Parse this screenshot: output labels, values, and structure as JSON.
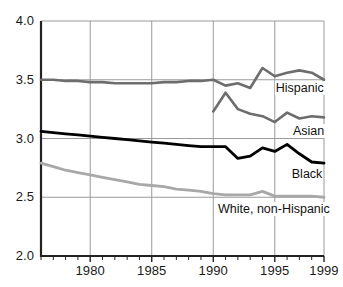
{
  "chart_data": {
    "type": "line",
    "title": "",
    "subtitle": "",
    "xlabel": "",
    "ylabel": "",
    "xlim": [
      1976,
      1999
    ],
    "ylim": [
      2.0,
      4.0
    ],
    "grid": "both",
    "legend_position": "inline-right-annotations",
    "y_ticks": [
      "4.0",
      "3.5",
      "3.0",
      "2.5",
      "2.0"
    ],
    "y_tick_values": [
      4.0,
      3.5,
      3.0,
      2.5,
      2.0
    ],
    "x_ticks": [
      "1980",
      "1985",
      "1990",
      "1995",
      "1999"
    ],
    "x_tick_values": [
      1980,
      1985,
      1990,
      1995,
      1999
    ],
    "x_minor_tick_interval": 1,
    "x": [
      1976,
      1977,
      1978,
      1979,
      1980,
      1981,
      1982,
      1983,
      1984,
      1985,
      1986,
      1987,
      1988,
      1989,
      1990,
      1991,
      1992,
      1993,
      1994,
      1995,
      1996,
      1997,
      1998,
      1999
    ],
    "series": [
      {
        "name": "Hispanic",
        "label": "Hispanic",
        "color": "#6d6d6d",
        "linewidth": 2.6,
        "values": [
          3.5,
          3.5,
          3.49,
          3.49,
          3.48,
          3.48,
          3.47,
          3.47,
          3.47,
          3.47,
          3.48,
          3.48,
          3.49,
          3.49,
          3.5,
          3.45,
          3.47,
          3.43,
          3.6,
          3.53,
          3.56,
          3.58,
          3.56,
          3.5
        ]
      },
      {
        "name": "Asian",
        "label": "Asian",
        "color": "#6d6d6d",
        "linewidth": 2.6,
        "values": [
          null,
          null,
          null,
          null,
          null,
          null,
          null,
          null,
          null,
          null,
          null,
          null,
          null,
          null,
          3.23,
          3.39,
          3.25,
          3.21,
          3.19,
          3.14,
          3.22,
          3.17,
          3.19,
          3.18
        ]
      },
      {
        "name": "Black",
        "label": "Black",
        "color": "#000000",
        "linewidth": 2.8,
        "values": [
          3.06,
          3.05,
          3.04,
          3.03,
          3.02,
          3.01,
          3.0,
          2.99,
          2.98,
          2.97,
          2.96,
          2.95,
          2.94,
          2.93,
          2.93,
          2.93,
          2.83,
          2.85,
          2.92,
          2.89,
          2.95,
          2.87,
          2.8,
          2.79
        ]
      },
      {
        "name": "White, non-Hispanic",
        "label": "White, non-Hispanic",
        "color": "#a8a8a8",
        "linewidth": 2.8,
        "values": [
          2.79,
          2.76,
          2.73,
          2.71,
          2.69,
          2.67,
          2.65,
          2.63,
          2.61,
          2.6,
          2.59,
          2.57,
          2.56,
          2.55,
          2.53,
          2.52,
          2.52,
          2.52,
          2.55,
          2.51,
          2.51,
          2.51,
          2.51,
          2.5
        ]
      }
    ],
    "annotations": [
      {
        "text": "Hispanic",
        "x": 1995.0,
        "y": 3.43
      },
      {
        "text": "Asian",
        "x": 1996.4,
        "y": 3.06
      },
      {
        "text": "Black",
        "x": 1996.3,
        "y": 2.7
      },
      {
        "text": "White, non-Hispanic",
        "x": 1993.0,
        "y": 2.4
      }
    ]
  },
  "axes": {
    "frame_color": "#222222",
    "grid_color": "#9a9a9a"
  }
}
